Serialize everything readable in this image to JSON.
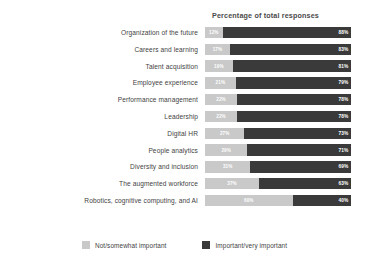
{
  "chart_data": {
    "type": "bar",
    "title": "Percentage of total responses",
    "subtitle": "",
    "xlabel": "",
    "ylabel": "",
    "xlim": [
      0,
      100
    ],
    "grid": false,
    "stacked": true,
    "orientation": "horizontal",
    "legend_position": "bottom",
    "categories": [
      "Organization of the future",
      "Careers and learning",
      "Talent acquisition",
      "Employee experience",
      "Performance management",
      "Leadership",
      "Digital HR",
      "People analytics",
      "Diversity and inclusion",
      "The augmented workforce",
      "Robotics, cognitive computing, and AI"
    ],
    "series": [
      {
        "name": "Not/somewhat important",
        "color": "#c9c9c9",
        "values": [
          12,
          17,
          19,
          21,
          22,
          22,
          27,
          29,
          31,
          37,
          60
        ],
        "labels": [
          "12%",
          "17%",
          "19%",
          "21%",
          "22%",
          "22%",
          "27%",
          "29%",
          "31%",
          "37%",
          "60%"
        ]
      },
      {
        "name": "Important/very important",
        "color": "#3a3a3a",
        "values": [
          88,
          83,
          81,
          79,
          78,
          78,
          73,
          71,
          69,
          63,
          40
        ],
        "labels": [
          "88%",
          "83%",
          "81%",
          "79%",
          "78%",
          "78%",
          "73%",
          "71%",
          "69%",
          "63%",
          "40%"
        ]
      }
    ]
  },
  "legend": {
    "items": [
      {
        "label": "Not/somewhat important",
        "swatch": "light"
      },
      {
        "label": "Important/very important",
        "swatch": "dark"
      }
    ]
  }
}
